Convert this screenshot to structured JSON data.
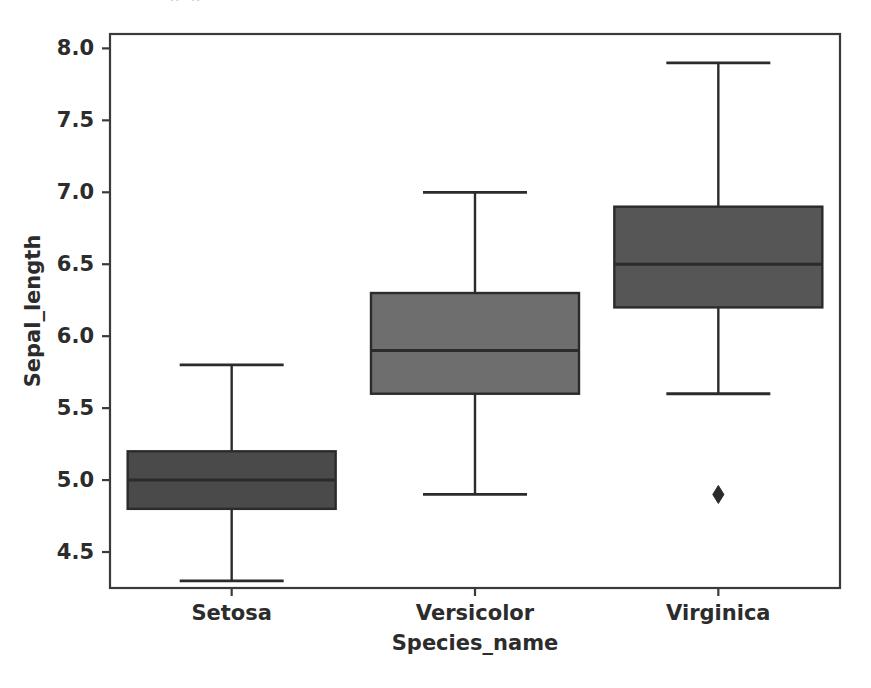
{
  "figure": {
    "width": 871,
    "height": 688,
    "background": "#ffffff",
    "frame_color": "#3a3a3a",
    "partial_text_above": "g  p"
  },
  "chart_data": {
    "type": "box",
    "title": "",
    "xlabel": "Species_name",
    "ylabel": "Sepal_length",
    "categories": [
      "Setosa",
      "Versicolor",
      "Virginica"
    ],
    "ylim": [
      4.25,
      8.1
    ],
    "yticks": [
      4.5,
      5.0,
      5.5,
      6.0,
      6.5,
      7.0,
      7.5,
      8.0
    ],
    "ytick_labels": [
      "4.5",
      "5.0",
      "5.5",
      "6.0",
      "6.5",
      "7.0",
      "7.5",
      "8.0"
    ],
    "grid": false,
    "legend": "none",
    "boxes": [
      {
        "name": "Setosa",
        "whisker_low": 4.3,
        "q1": 4.8,
        "median": 5.0,
        "q3": 5.2,
        "whisker_high": 5.8,
        "outliers": [],
        "fill": "#4a4a4a",
        "edge": "#2b2b2b"
      },
      {
        "name": "Versicolor",
        "whisker_low": 4.9,
        "q1": 5.6,
        "median": 5.9,
        "q3": 6.3,
        "whisker_high": 7.0,
        "outliers": [],
        "fill": "#6e6e6e",
        "edge": "#2b2b2b"
      },
      {
        "name": "Virginica",
        "whisker_low": 5.6,
        "q1": 6.2,
        "median": 6.5,
        "q3": 6.9,
        "whisker_high": 7.9,
        "outliers": [
          4.9
        ],
        "fill": "#565656",
        "edge": "#2b2b2b"
      }
    ]
  }
}
